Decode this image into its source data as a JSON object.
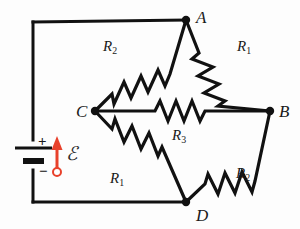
{
  "figure": {
    "type": "circuit-diagram",
    "name": "Wheatstone bridge circuit",
    "background_color": "#fdfdfd",
    "wire_color": "#111111",
    "accent_color": "#e8412b"
  },
  "nodes": [
    {
      "id": "A",
      "label": "A",
      "x": 186,
      "y": 20,
      "label_x": 196,
      "label_y": 9
    },
    {
      "id": "B",
      "label": "B",
      "x": 270,
      "y": 111,
      "label_x": 279,
      "label_y": 103
    },
    {
      "id": "C",
      "label": "C",
      "x": 95,
      "y": 111,
      "label_x": 76,
      "label_y": 103
    },
    {
      "id": "D",
      "label": "D",
      "x": 186,
      "y": 202,
      "label_x": 196,
      "label_y": 207
    }
  ],
  "resistors": [
    {
      "id": "R2-top-left",
      "label": "R",
      "subscript": "2",
      "branch": "C-A",
      "label_x": 103,
      "label_y": 39
    },
    {
      "id": "R1-top-right",
      "label": "R",
      "subscript": "1",
      "branch": "A-B",
      "label_x": 237,
      "label_y": 39
    },
    {
      "id": "R3-bridge",
      "label": "R",
      "subscript": "3",
      "branch": "C-B",
      "label_x": 172,
      "label_y": 128
    },
    {
      "id": "R1-bottom-left",
      "label": "R",
      "subscript": "1",
      "branch": "C-D",
      "label_x": 110,
      "label_y": 171
    },
    {
      "id": "R2-bottom-right",
      "label": "R",
      "subscript": "2",
      "branch": "D-B",
      "label_x": 236,
      "label_y": 166
    }
  ],
  "source": {
    "name": "battery",
    "emf_symbol": "ℰ",
    "emf_label_x": 63,
    "emf_label_y": 147,
    "plus_sign": "+",
    "plus_x": 38,
    "plus_y": 141,
    "minus_sign": "−",
    "minus_x": 39,
    "minus_y": 167,
    "arrow_color": "#e8412b",
    "arrow_x": 57,
    "arrow_top_y": 140,
    "arrow_bottom_y": 172
  },
  "wires": {
    "outer_left_x": 33,
    "outer_top_y": 22,
    "outer_bottom_y": 202,
    "battery_center_y": 155
  }
}
